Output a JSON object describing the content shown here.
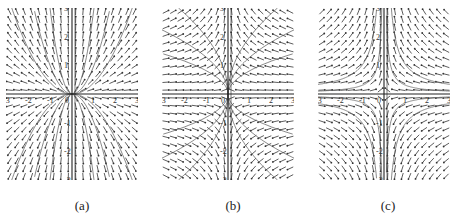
{
  "figure": {
    "panels": [
      {
        "id": "a",
        "caption": "(a)",
        "left": 6,
        "width": 132,
        "height": 172,
        "xrange": [
          -3,
          3
        ],
        "yrange": [
          -3,
          3
        ],
        "field": "node_parabolic",
        "xticks": [
          "-3",
          "-2",
          "-1",
          "0",
          "1",
          "2",
          "3"
        ],
        "yticks": [
          "3",
          "2",
          "1",
          "-1",
          "-2",
          "-3"
        ],
        "trajectories": "y = c*x^2"
      },
      {
        "id": "b",
        "caption": "(b)",
        "left": 162,
        "width": 132,
        "height": 172,
        "xrange": [
          -3,
          3
        ],
        "yrange": [
          -3,
          3
        ],
        "field": "converge_y_axis",
        "xticks": [
          "-3",
          "-2",
          "-1",
          "0",
          "1",
          "2",
          "3"
        ],
        "yticks": [
          "3",
          "2",
          "1",
          "-1",
          "-2",
          "-3"
        ],
        "trajectories": "x = c*y^2"
      },
      {
        "id": "c",
        "caption": "(c)",
        "left": 318,
        "width": 132,
        "height": 172,
        "xrange": [
          -3,
          3
        ],
        "yrange": [
          -3,
          3
        ],
        "field": "saddle",
        "xticks": [
          "-3",
          "-2",
          "-1",
          "0",
          "1",
          "2",
          "3"
        ],
        "yticks": [
          "3",
          "2",
          "1",
          "-1",
          "-2",
          "-3"
        ],
        "trajectories": "y = c/x"
      }
    ],
    "colors": {
      "arrow": "#333333",
      "axis": "#222222",
      "curve": "#555555"
    }
  }
}
